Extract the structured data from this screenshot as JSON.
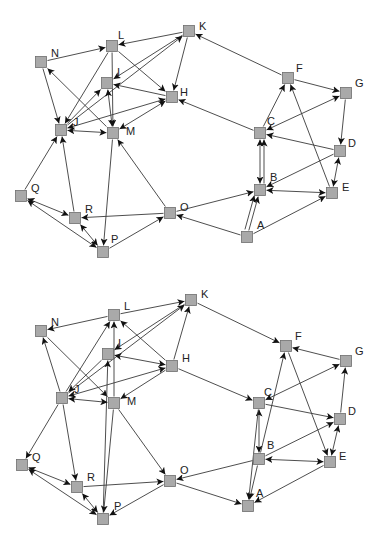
{
  "colors": {
    "node_fill": "#a9a9a9",
    "node_stroke": "#6e6e6e",
    "edge": "#3a3a3a",
    "label": "#222222",
    "background": "#ffffff"
  },
  "graphs": [
    {
      "id": "top-graph",
      "node_size": 11,
      "nodes": [
        {
          "id": "K",
          "label": "K",
          "x": 189,
          "y": 31,
          "lx": 14,
          "ly": -5
        },
        {
          "id": "L",
          "label": "L",
          "x": 112,
          "y": 46,
          "lx": 10,
          "ly": -11
        },
        {
          "id": "N",
          "label": "N",
          "x": 41,
          "y": 62,
          "lx": 14,
          "ly": -9
        },
        {
          "id": "I",
          "label": "I",
          "x": 107,
          "y": 83,
          "lx": 14,
          "ly": -11
        },
        {
          "id": "H",
          "label": "H",
          "x": 172,
          "y": 97,
          "lx": 12,
          "ly": -5
        },
        {
          "id": "J",
          "label": "J",
          "x": 61,
          "y": 130,
          "lx": 16,
          "ly": -8
        },
        {
          "id": "M",
          "label": "M",
          "x": 113,
          "y": 133,
          "lx": 17,
          "ly": -2
        },
        {
          "id": "F",
          "label": "F",
          "x": 288,
          "y": 78,
          "lx": 12,
          "ly": -10
        },
        {
          "id": "G",
          "label": "G",
          "x": 346,
          "y": 93,
          "lx": 13,
          "ly": -10
        },
        {
          "id": "C",
          "label": "C",
          "x": 260,
          "y": 133,
          "lx": 11,
          "ly": -12
        },
        {
          "id": "D",
          "label": "D",
          "x": 340,
          "y": 151,
          "lx": 12,
          "ly": -8
        },
        {
          "id": "B",
          "label": "B",
          "x": 260,
          "y": 190,
          "lx": 14,
          "ly": -13
        },
        {
          "id": "E",
          "label": "E",
          "x": 332,
          "y": 193,
          "lx": 14,
          "ly": -6
        },
        {
          "id": "A",
          "label": "A",
          "x": 247,
          "y": 237,
          "lx": 14,
          "ly": -12
        },
        {
          "id": "O",
          "label": "O",
          "x": 170,
          "y": 213,
          "lx": 14,
          "ly": -6
        },
        {
          "id": "Q",
          "label": "Q",
          "x": 21,
          "y": 196,
          "lx": 14,
          "ly": -8
        },
        {
          "id": "R",
          "label": "R",
          "x": 75,
          "y": 218,
          "lx": 14,
          "ly": -9
        },
        {
          "id": "P",
          "label": "P",
          "x": 103,
          "y": 252,
          "lx": 12,
          "ly": -13
        }
      ],
      "edges": [
        {
          "from": "K",
          "to": "L",
          "bidirectional": false
        },
        {
          "from": "N",
          "to": "L",
          "bidirectional": false
        },
        {
          "from": "K",
          "to": "I",
          "bidirectional": false
        },
        {
          "from": "K",
          "to": "H",
          "bidirectional": false
        },
        {
          "from": "J",
          "to": "K",
          "bidirectional": false
        },
        {
          "from": "L",
          "to": "J",
          "bidirectional": false
        },
        {
          "from": "L",
          "to": "M",
          "bidirectional": false
        },
        {
          "from": "L",
          "to": "H",
          "bidirectional": false
        },
        {
          "from": "N",
          "to": "J",
          "bidirectional": false
        },
        {
          "from": "M",
          "to": "N",
          "bidirectional": false
        },
        {
          "from": "H",
          "to": "I",
          "bidirectional": false
        },
        {
          "from": "J",
          "to": "H",
          "bidirectional": true
        },
        {
          "from": "M",
          "to": "H",
          "bidirectional": true
        },
        {
          "from": "I",
          "to": "M",
          "bidirectional": true
        },
        {
          "from": "J",
          "to": "M",
          "bidirectional": true
        },
        {
          "from": "J",
          "to": "I",
          "bidirectional": false
        },
        {
          "from": "Q",
          "to": "J",
          "bidirectional": false
        },
        {
          "from": "R",
          "to": "J",
          "bidirectional": false
        },
        {
          "from": "M",
          "to": "P",
          "bidirectional": false
        },
        {
          "from": "O",
          "to": "M",
          "bidirectional": false
        },
        {
          "from": "Q",
          "to": "R",
          "bidirectional": true
        },
        {
          "from": "Q",
          "to": "P",
          "bidirectional": true
        },
        {
          "from": "R",
          "to": "P",
          "bidirectional": true
        },
        {
          "from": "O",
          "to": "R",
          "bidirectional": false
        },
        {
          "from": "P",
          "to": "O",
          "bidirectional": false
        },
        {
          "from": "O",
          "to": "B",
          "bidirectional": false
        },
        {
          "from": "A",
          "to": "O",
          "bidirectional": false
        },
        {
          "from": "F",
          "to": "K",
          "bidirectional": false
        },
        {
          "from": "C",
          "to": "H",
          "bidirectional": false
        },
        {
          "from": "F",
          "to": "G",
          "bidirectional": false
        },
        {
          "from": "C",
          "to": "F",
          "bidirectional": false
        },
        {
          "from": "E",
          "to": "F",
          "bidirectional": false
        },
        {
          "from": "G",
          "to": "C",
          "bidirectional": true
        },
        {
          "from": "G",
          "to": "D",
          "bidirectional": false
        },
        {
          "from": "D",
          "to": "C",
          "bidirectional": false
        },
        {
          "from": "C",
          "to": "B",
          "bidirectional": true
        },
        {
          "from": "B",
          "to": "C",
          "bidirectional": false,
          "offset": 4
        },
        {
          "from": "D",
          "to": "B",
          "bidirectional": false
        },
        {
          "from": "D",
          "to": "E",
          "bidirectional": true
        },
        {
          "from": "B",
          "to": "E",
          "bidirectional": true
        },
        {
          "from": "A",
          "to": "B",
          "bidirectional": false
        },
        {
          "from": "A",
          "to": "B",
          "bidirectional": false,
          "offset": -4
        },
        {
          "from": "A",
          "to": "E",
          "bidirectional": false
        }
      ]
    },
    {
      "id": "bottom-graph",
      "node_size": 11,
      "nodes": [
        {
          "id": "K",
          "label": "K",
          "x": 191,
          "y": 300,
          "lx": 14,
          "ly": -6
        },
        {
          "id": "L",
          "label": "L",
          "x": 114,
          "y": 315,
          "lx": 14,
          "ly": -9
        },
        {
          "id": "N",
          "label": "N",
          "x": 41,
          "y": 331,
          "lx": 14,
          "ly": -9
        },
        {
          "id": "I",
          "label": "I",
          "x": 108,
          "y": 354,
          "lx": 14,
          "ly": -11
        },
        {
          "id": "H",
          "label": "H",
          "x": 172,
          "y": 366,
          "lx": 14,
          "ly": -8
        },
        {
          "id": "J",
          "label": "J",
          "x": 62,
          "y": 398,
          "lx": 16,
          "ly": -9
        },
        {
          "id": "M",
          "label": "M",
          "x": 114,
          "y": 403,
          "lx": 17,
          "ly": -2
        },
        {
          "id": "F",
          "label": "F",
          "x": 286,
          "y": 346,
          "lx": 13,
          "ly": -10
        },
        {
          "id": "G",
          "label": "G",
          "x": 346,
          "y": 361,
          "lx": 13,
          "ly": -10
        },
        {
          "id": "C",
          "label": "C",
          "x": 259,
          "y": 403,
          "lx": 9,
          "ly": -11
        },
        {
          "id": "D",
          "label": "D",
          "x": 340,
          "y": 419,
          "lx": 12,
          "ly": -8
        },
        {
          "id": "B",
          "label": "B",
          "x": 259,
          "y": 459,
          "lx": 12,
          "ly": -14
        },
        {
          "id": "E",
          "label": "E",
          "x": 330,
          "y": 462,
          "lx": 13,
          "ly": -6
        },
        {
          "id": "A",
          "label": "A",
          "x": 248,
          "y": 506,
          "lx": 12,
          "ly": -13
        },
        {
          "id": "O",
          "label": "O",
          "x": 170,
          "y": 481,
          "lx": 14,
          "ly": -11
        },
        {
          "id": "Q",
          "label": "Q",
          "x": 22,
          "y": 465,
          "lx": 14,
          "ly": -8
        },
        {
          "id": "R",
          "label": "R",
          "x": 77,
          "y": 487,
          "lx": 14,
          "ly": -10
        },
        {
          "id": "P",
          "label": "P",
          "x": 103,
          "y": 519,
          "lx": 15,
          "ly": -13
        }
      ],
      "edges": [
        {
          "from": "L",
          "to": "K",
          "bidirectional": false
        },
        {
          "from": "L",
          "to": "N",
          "bidirectional": false
        },
        {
          "from": "K",
          "to": "I",
          "bidirectional": false
        },
        {
          "from": "H",
          "to": "K",
          "bidirectional": false
        },
        {
          "from": "J",
          "to": "K",
          "bidirectional": false
        },
        {
          "from": "J",
          "to": "L",
          "bidirectional": false
        },
        {
          "from": "M",
          "to": "L",
          "bidirectional": false
        },
        {
          "from": "H",
          "to": "L",
          "bidirectional": false
        },
        {
          "from": "J",
          "to": "N",
          "bidirectional": false
        },
        {
          "from": "N",
          "to": "M",
          "bidirectional": false
        },
        {
          "from": "H",
          "to": "I",
          "bidirectional": true
        },
        {
          "from": "J",
          "to": "H",
          "bidirectional": true
        },
        {
          "from": "H",
          "to": "M",
          "bidirectional": false
        },
        {
          "from": "P",
          "to": "I",
          "bidirectional": false
        },
        {
          "from": "I",
          "to": "J",
          "bidirectional": false
        },
        {
          "from": "J",
          "to": "M",
          "bidirectional": true
        },
        {
          "from": "J",
          "to": "Q",
          "bidirectional": false
        },
        {
          "from": "J",
          "to": "R",
          "bidirectional": false
        },
        {
          "from": "M",
          "to": "P",
          "bidirectional": false
        },
        {
          "from": "M",
          "to": "O",
          "bidirectional": false
        },
        {
          "from": "Q",
          "to": "R",
          "bidirectional": true
        },
        {
          "from": "Q",
          "to": "P",
          "bidirectional": true
        },
        {
          "from": "R",
          "to": "P",
          "bidirectional": true
        },
        {
          "from": "R",
          "to": "O",
          "bidirectional": false
        },
        {
          "from": "O",
          "to": "P",
          "bidirectional": false
        },
        {
          "from": "B",
          "to": "O",
          "bidirectional": false
        },
        {
          "from": "O",
          "to": "A",
          "bidirectional": false
        },
        {
          "from": "K",
          "to": "F",
          "bidirectional": false
        },
        {
          "from": "H",
          "to": "C",
          "bidirectional": false
        },
        {
          "from": "G",
          "to": "F",
          "bidirectional": false
        },
        {
          "from": "B",
          "to": "F",
          "bidirectional": false
        },
        {
          "from": "F",
          "to": "E",
          "bidirectional": false
        },
        {
          "from": "C",
          "to": "G",
          "bidirectional": true
        },
        {
          "from": "D",
          "to": "G",
          "bidirectional": false
        },
        {
          "from": "C",
          "to": "D",
          "bidirectional": false
        },
        {
          "from": "C",
          "to": "B",
          "bidirectional": true
        },
        {
          "from": "B",
          "to": "D",
          "bidirectional": false
        },
        {
          "from": "D",
          "to": "E",
          "bidirectional": true
        },
        {
          "from": "B",
          "to": "E",
          "bidirectional": true
        },
        {
          "from": "B",
          "to": "A",
          "bidirectional": false
        },
        {
          "from": "C",
          "to": "A",
          "bidirectional": false
        },
        {
          "from": "E",
          "to": "A",
          "bidirectional": false
        }
      ]
    }
  ]
}
